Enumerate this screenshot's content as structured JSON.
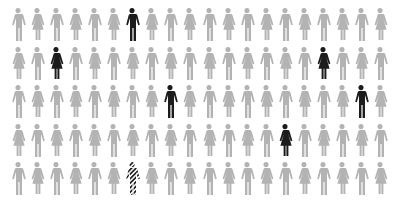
{
  "title_fragment": "",
  "colors": {
    "default": "#b3b3b3",
    "highlight": "#1c1c1c",
    "stripe": "#1c1c1c"
  },
  "layout": {
    "cols": 20,
    "rows": 5,
    "x0": 9,
    "dx": 19.05,
    "y0": 8,
    "dy": 38.5
  },
  "rows": [
    {
      "start": "m",
      "highlights": [
        {
          "index": 6,
          "style": "solid"
        }
      ]
    },
    {
      "start": "f",
      "highlights": [
        {
          "index": 2,
          "style": "solid"
        },
        {
          "index": 16,
          "style": "solid"
        }
      ]
    },
    {
      "start": "m",
      "highlights": [
        {
          "index": 8,
          "style": "solid"
        },
        {
          "index": 18,
          "style": "solid"
        }
      ]
    },
    {
      "start": "f",
      "highlights": [
        {
          "index": 14,
          "style": "solid"
        }
      ]
    },
    {
      "start": "m",
      "highlights": [
        {
          "index": 6,
          "style": "striped"
        }
      ]
    }
  ]
}
